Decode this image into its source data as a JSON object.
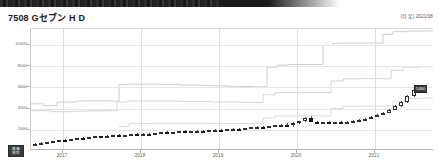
{
  "header": {
    "title": "7508 Gセブン H D",
    "meta": "(月足) 2021/08"
  },
  "corner_tag": {
    "line1": "株価",
    "line2": "倍率"
  },
  "price_tag": {
    "label": "5,800"
  },
  "chart_data": {
    "type": "line",
    "title": "7508 Gセブン H D",
    "subtitle": "(月足) 2021/08",
    "xlabel": "",
    "ylabel": "",
    "grid": true,
    "legend_position": "none",
    "ylim": [
      0,
      11500
    ],
    "yticks": [
      2000,
      4000,
      6000,
      8000,
      10000
    ],
    "ytick_labels": [
      "2000",
      "4000",
      "6000",
      "8000",
      "10000"
    ],
    "xticks": [
      "2017",
      "2018",
      "2019",
      "2020",
      "2021"
    ],
    "xtick_positions_px": [
      62,
      140,
      218,
      296,
      374
    ],
    "x_range_label": "2016-01 to 2021-08",
    "series": [
      {
        "name": "理論株価 上限 (step line A)",
        "color": "#c8c8c8",
        "style": "step",
        "points": [
          [
            0,
            4450
          ],
          [
            6,
            4450
          ],
          [
            12,
            4280
          ],
          [
            18,
            4280
          ],
          [
            26,
            4600
          ],
          [
            34,
            4620
          ],
          [
            44,
            4700
          ],
          [
            52,
            4720
          ],
          [
            62,
            4720
          ],
          [
            72,
            4720
          ],
          [
            80,
            4700
          ],
          [
            88,
            6250
          ],
          [
            96,
            6300
          ],
          [
            110,
            6300
          ],
          [
            130,
            6280
          ],
          [
            150,
            6220
          ],
          [
            168,
            6180
          ],
          [
            180,
            6150
          ],
          [
            196,
            6100
          ],
          [
            208,
            6080
          ],
          [
            222,
            6050
          ],
          [
            236,
            7900
          ],
          [
            246,
            8100
          ],
          [
            258,
            8150
          ],
          [
            270,
            8150
          ],
          [
            282,
            8150
          ],
          [
            292,
            9950
          ],
          [
            302,
            10150
          ],
          [
            316,
            10180
          ],
          [
            330,
            10180
          ],
          [
            342,
            10170
          ],
          [
            352,
            11000
          ],
          [
            362,
            11250
          ],
          [
            376,
            11300
          ],
          [
            392,
            11320
          ],
          [
            403,
            11330
          ]
        ]
      },
      {
        "name": "理論株価 中位 (step line B)",
        "color": "#d0d0d0",
        "style": "step",
        "points": [
          [
            0,
            3800
          ],
          [
            10,
            3800
          ],
          [
            20,
            3700
          ],
          [
            30,
            3700
          ],
          [
            44,
            3750
          ],
          [
            56,
            3780
          ],
          [
            70,
            3790
          ],
          [
            80,
            3790
          ],
          [
            86,
            4620
          ],
          [
            96,
            4700
          ],
          [
            120,
            4700
          ],
          [
            150,
            4680
          ],
          [
            180,
            4620
          ],
          [
            210,
            4580
          ],
          [
            222,
            4560
          ],
          [
            232,
            5300
          ],
          [
            244,
            5500
          ],
          [
            262,
            5520
          ],
          [
            280,
            5520
          ],
          [
            292,
            5500
          ],
          [
            300,
            6600
          ],
          [
            312,
            6800
          ],
          [
            330,
            6820
          ],
          [
            344,
            6820
          ],
          [
            352,
            6800
          ],
          [
            360,
            7600
          ],
          [
            372,
            7900
          ],
          [
            388,
            7950
          ],
          [
            403,
            7960
          ]
        ]
      },
      {
        "name": "理論株価 下限 (step line C)",
        "color": "#d6d6d6",
        "style": "step",
        "points": [
          [
            88,
            2300
          ],
          [
            98,
            2600
          ],
          [
            120,
            2620
          ],
          [
            150,
            2620
          ],
          [
            180,
            2600
          ],
          [
            210,
            2580
          ],
          [
            222,
            2570
          ],
          [
            232,
            3100
          ],
          [
            244,
            3300
          ],
          [
            262,
            3320
          ],
          [
            282,
            3320
          ],
          [
            292,
            3300
          ],
          [
            300,
            4000
          ],
          [
            312,
            4200
          ],
          [
            330,
            4230
          ],
          [
            346,
            4230
          ],
          [
            354,
            4230
          ],
          [
            362,
            4700
          ],
          [
            374,
            4950
          ],
          [
            390,
            5000
          ],
          [
            403,
            5010
          ]
        ]
      }
    ],
    "candles": [
      {
        "x": 34,
        "o": 620,
        "h": 760,
        "l": 560,
        "c": 700,
        "dir": "up"
      },
      {
        "x": 40,
        "o": 700,
        "h": 840,
        "l": 660,
        "c": 800,
        "dir": "up"
      },
      {
        "x": 46,
        "o": 800,
        "h": 900,
        "l": 760,
        "c": 860,
        "dir": "up"
      },
      {
        "x": 52,
        "o": 860,
        "h": 980,
        "l": 830,
        "c": 950,
        "dir": "up"
      },
      {
        "x": 58,
        "o": 950,
        "h": 1080,
        "l": 920,
        "c": 1040,
        "dir": "up"
      },
      {
        "x": 64,
        "o": 1040,
        "h": 1120,
        "l": 990,
        "c": 1010,
        "dir": "down"
      },
      {
        "x": 70,
        "o": 1010,
        "h": 1150,
        "l": 1000,
        "c": 1120,
        "dir": "up"
      },
      {
        "x": 76,
        "o": 1120,
        "h": 1260,
        "l": 1090,
        "c": 1230,
        "dir": "up"
      },
      {
        "x": 82,
        "o": 1230,
        "h": 1320,
        "l": 1180,
        "c": 1200,
        "dir": "down"
      },
      {
        "x": 88,
        "o": 1200,
        "h": 1340,
        "l": 1170,
        "c": 1310,
        "dir": "up"
      },
      {
        "x": 94,
        "o": 1310,
        "h": 1420,
        "l": 1280,
        "c": 1390,
        "dir": "up"
      },
      {
        "x": 100,
        "o": 1390,
        "h": 1460,
        "l": 1330,
        "c": 1360,
        "dir": "down"
      },
      {
        "x": 106,
        "o": 1360,
        "h": 1470,
        "l": 1330,
        "c": 1440,
        "dir": "up"
      },
      {
        "x": 112,
        "o": 1440,
        "h": 1540,
        "l": 1410,
        "c": 1500,
        "dir": "up"
      },
      {
        "x": 118,
        "o": 1500,
        "h": 1580,
        "l": 1450,
        "c": 1470,
        "dir": "down"
      },
      {
        "x": 124,
        "o": 1470,
        "h": 1560,
        "l": 1430,
        "c": 1520,
        "dir": "up"
      },
      {
        "x": 130,
        "o": 1520,
        "h": 1620,
        "l": 1490,
        "c": 1590,
        "dir": "up"
      },
      {
        "x": 136,
        "o": 1590,
        "h": 1680,
        "l": 1550,
        "c": 1560,
        "dir": "down"
      },
      {
        "x": 142,
        "o": 1560,
        "h": 1660,
        "l": 1520,
        "c": 1630,
        "dir": "up"
      },
      {
        "x": 148,
        "o": 1630,
        "h": 1700,
        "l": 1580,
        "c": 1600,
        "dir": "down"
      },
      {
        "x": 154,
        "o": 1600,
        "h": 1740,
        "l": 1570,
        "c": 1710,
        "dir": "up"
      },
      {
        "x": 160,
        "o": 1710,
        "h": 1820,
        "l": 1680,
        "c": 1780,
        "dir": "up"
      },
      {
        "x": 166,
        "o": 1780,
        "h": 1860,
        "l": 1700,
        "c": 1730,
        "dir": "down"
      },
      {
        "x": 172,
        "o": 1730,
        "h": 1840,
        "l": 1700,
        "c": 1800,
        "dir": "up"
      },
      {
        "x": 178,
        "o": 1800,
        "h": 1900,
        "l": 1760,
        "c": 1860,
        "dir": "up"
      },
      {
        "x": 184,
        "o": 1860,
        "h": 1940,
        "l": 1790,
        "c": 1820,
        "dir": "down"
      },
      {
        "x": 190,
        "o": 1820,
        "h": 1920,
        "l": 1770,
        "c": 1880,
        "dir": "up"
      },
      {
        "x": 196,
        "o": 1880,
        "h": 1980,
        "l": 1840,
        "c": 1930,
        "dir": "up"
      },
      {
        "x": 202,
        "o": 1930,
        "h": 2010,
        "l": 1850,
        "c": 1880,
        "dir": "down"
      },
      {
        "x": 208,
        "o": 1880,
        "h": 1980,
        "l": 1840,
        "c": 1940,
        "dir": "up"
      },
      {
        "x": 214,
        "o": 1940,
        "h": 2060,
        "l": 1900,
        "c": 2020,
        "dir": "up"
      },
      {
        "x": 220,
        "o": 2020,
        "h": 2110,
        "l": 1950,
        "c": 1980,
        "dir": "down"
      },
      {
        "x": 226,
        "o": 1980,
        "h": 2090,
        "l": 1940,
        "c": 2050,
        "dir": "up"
      },
      {
        "x": 232,
        "o": 2050,
        "h": 2160,
        "l": 2000,
        "c": 2120,
        "dir": "up"
      },
      {
        "x": 238,
        "o": 2120,
        "h": 2200,
        "l": 2050,
        "c": 2080,
        "dir": "down"
      },
      {
        "x": 244,
        "o": 2080,
        "h": 2190,
        "l": 2040,
        "c": 2150,
        "dir": "up"
      },
      {
        "x": 250,
        "o": 2150,
        "h": 2260,
        "l": 2100,
        "c": 2220,
        "dir": "up"
      },
      {
        "x": 256,
        "o": 2220,
        "h": 2340,
        "l": 2180,
        "c": 2300,
        "dir": "up"
      },
      {
        "x": 262,
        "o": 2300,
        "h": 2400,
        "l": 2220,
        "c": 2260,
        "dir": "down"
      },
      {
        "x": 268,
        "o": 2260,
        "h": 2380,
        "l": 2200,
        "c": 2340,
        "dir": "up"
      },
      {
        "x": 274,
        "o": 2340,
        "h": 2480,
        "l": 2300,
        "c": 2440,
        "dir": "up"
      },
      {
        "x": 280,
        "o": 2440,
        "h": 2560,
        "l": 2380,
        "c": 2500,
        "dir": "up"
      },
      {
        "x": 286,
        "o": 2500,
        "h": 2620,
        "l": 2400,
        "c": 2440,
        "dir": "down"
      },
      {
        "x": 292,
        "o": 2440,
        "h": 2700,
        "l": 2300,
        "c": 2640,
        "dir": "up"
      },
      {
        "x": 298,
        "o": 2640,
        "h": 2860,
        "l": 2580,
        "c": 2800,
        "dir": "up"
      },
      {
        "x": 304,
        "o": 2800,
        "h": 3180,
        "l": 2760,
        "c": 3120,
        "dir": "up"
      },
      {
        "x": 310,
        "o": 3120,
        "h": 3300,
        "l": 2700,
        "c": 2740,
        "dir": "down"
      },
      {
        "x": 316,
        "o": 2740,
        "h": 2860,
        "l": 2600,
        "c": 2660,
        "dir": "down"
      },
      {
        "x": 322,
        "o": 2660,
        "h": 2780,
        "l": 2580,
        "c": 2700,
        "dir": "up"
      },
      {
        "x": 328,
        "o": 2700,
        "h": 2820,
        "l": 2620,
        "c": 2660,
        "dir": "down"
      },
      {
        "x": 334,
        "o": 2660,
        "h": 2780,
        "l": 2580,
        "c": 2720,
        "dir": "up"
      },
      {
        "x": 340,
        "o": 2720,
        "h": 2840,
        "l": 2640,
        "c": 2680,
        "dir": "down"
      },
      {
        "x": 346,
        "o": 2680,
        "h": 2800,
        "l": 2620,
        "c": 2760,
        "dir": "up"
      },
      {
        "x": 352,
        "o": 2760,
        "h": 2900,
        "l": 2700,
        "c": 2840,
        "dir": "up"
      },
      {
        "x": 358,
        "o": 2840,
        "h": 3000,
        "l": 2780,
        "c": 2940,
        "dir": "up"
      },
      {
        "x": 364,
        "o": 2940,
        "h": 3120,
        "l": 2880,
        "c": 3060,
        "dir": "up"
      },
      {
        "x": 370,
        "o": 3060,
        "h": 3280,
        "l": 3000,
        "c": 3220,
        "dir": "up"
      },
      {
        "x": 376,
        "o": 3220,
        "h": 3480,
        "l": 3160,
        "c": 3400,
        "dir": "up"
      },
      {
        "x": 382,
        "o": 3400,
        "h": 3700,
        "l": 3340,
        "c": 3620,
        "dir": "up"
      },
      {
        "x": 388,
        "o": 3620,
        "h": 3980,
        "l": 3540,
        "c": 3900,
        "dir": "up"
      },
      {
        "x": 394,
        "o": 3900,
        "h": 4300,
        "l": 3820,
        "c": 4200,
        "dir": "up"
      },
      {
        "x": 400,
        "o": 4200,
        "h": 4700,
        "l": 4120,
        "c": 4600,
        "dir": "up"
      },
      {
        "x": 406,
        "o": 4600,
        "h": 5300,
        "l": 4480,
        "c": 5200,
        "dir": "up"
      },
      {
        "x": 413,
        "o": 5200,
        "h": 5900,
        "l": 5050,
        "c": 5800,
        "dir": "up"
      }
    ]
  }
}
